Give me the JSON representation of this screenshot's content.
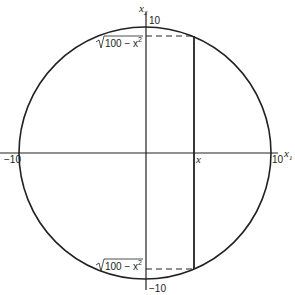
{
  "diagram": {
    "axes": {
      "x_label": "x",
      "x_sub": "1",
      "y_label": "x",
      "y_sub": "2",
      "x_min_tick": "−10",
      "x_max_tick": "10",
      "y_max_tick": "10",
      "y_min_tick": "−10"
    },
    "point_label": "x",
    "top_expr": {
      "radical": "100 − x",
      "exp": "2"
    },
    "bottom_expr": {
      "radical": "100 − x",
      "exp": "2"
    },
    "stroke_color": "#222222"
  }
}
